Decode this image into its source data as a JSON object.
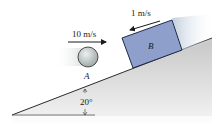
{
  "figure": {
    "incline_angle_label": "20°",
    "ball": {
      "label": "A",
      "velocity_label": "10 m/s",
      "direction": "right"
    },
    "block": {
      "label": "B",
      "velocity_label": "1 m/s",
      "direction": "down-incline"
    }
  },
  "colors": {
    "block_fill": "#8f9fcb",
    "block_stroke": "#1e2a4a",
    "ball_fill": "#c9cfcf",
    "ground_shade": "#cfcfcf",
    "line": "#2a2a2a"
  }
}
